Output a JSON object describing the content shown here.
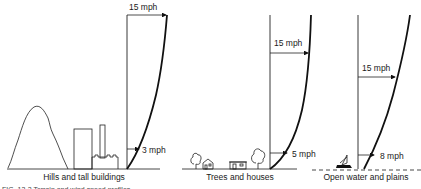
{
  "panels": [
    {
      "id": "hills",
      "caption": "Hills and tall buildings",
      "top_speed": "15 mph",
      "ground_speed": "3 mph"
    },
    {
      "id": "trees",
      "caption": "Trees and houses",
      "top_speed": "15 mph",
      "ground_speed": "5 mph"
    },
    {
      "id": "water",
      "caption": "Open water and plains",
      "top_speed": "15 mph",
      "ground_speed": "8 mph"
    }
  ],
  "figure_caption": "FIG. 13-2  Terrain and wind speed profiles"
}
